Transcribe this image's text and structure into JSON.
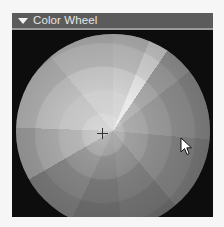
{
  "panel": {
    "title": "Color Wheel",
    "collapse_icon": "triangle-down-icon",
    "expanded": true
  },
  "wheel": {
    "type": "hue-saturation-wheel",
    "selector_icon": "crosshair-icon",
    "selector_position": {
      "x": 102,
      "y": 133
    },
    "colors": {
      "panel_bg": "#0c0c0c",
      "header_bg": "#5b5b5b",
      "header_text": "#e6e6e6"
    }
  },
  "mouse_cursor": {
    "icon": "arrow-cursor-icon",
    "position": {
      "x": 181,
      "y": 138
    }
  }
}
